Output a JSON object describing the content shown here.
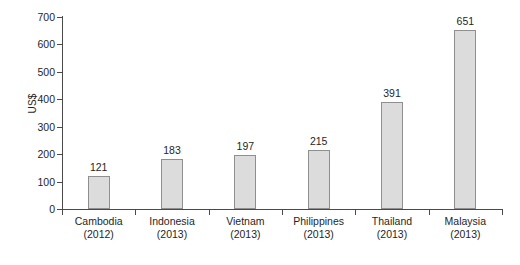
{
  "chart_data": {
    "type": "bar",
    "title": "",
    "xlabel": "",
    "ylabel": "US$",
    "ylim": [
      0,
      700
    ],
    "yticks": [
      0,
      100,
      200,
      300,
      400,
      500,
      600,
      700
    ],
    "ytick_labels": [
      "0",
      "100",
      "200",
      "300",
      "400",
      "500",
      "600",
      "700"
    ],
    "grid": false,
    "legend": null,
    "categories": [
      "Cambodia",
      "Indonesia",
      "Vietnam",
      "Philippines",
      "Thailand",
      "Malaysia"
    ],
    "category_years": [
      "(2012)",
      "(2013)",
      "(2013)",
      "(2013)",
      "(2013)",
      "(2013)"
    ],
    "values": [
      121,
      183,
      197,
      215,
      391,
      651
    ],
    "value_labels": [
      "121",
      "183",
      "197",
      "215",
      "391",
      "651"
    ],
    "bar_fill_color": "#dcdcdc",
    "bar_border_color": "#8f8f8f",
    "axis_color": "#4a4a4a",
    "background_color": "#ffffff"
  }
}
